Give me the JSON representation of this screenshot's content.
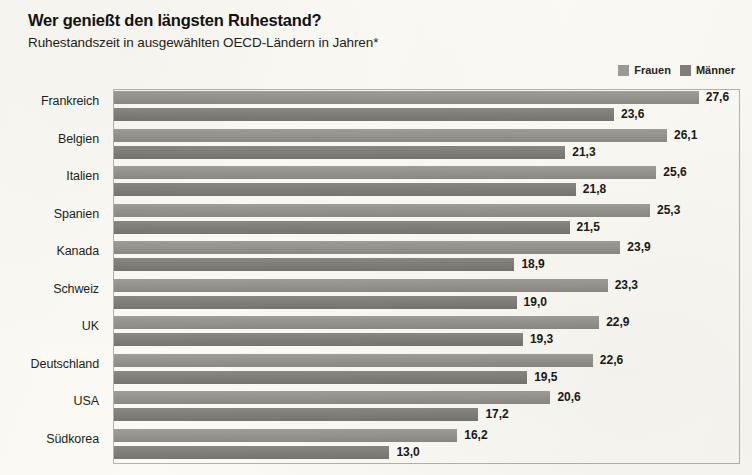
{
  "header": {
    "title": "Wer genießt den längsten Ruhestand?",
    "subtitle": "Ruhestandszeit in ausgewählten OECD-Ländern in Jahren*"
  },
  "legend": {
    "items": [
      {
        "label": "Frauen",
        "color": "#9b9a93",
        "swatch_name": "legend-swatch-frauen"
      },
      {
        "label": "Männer",
        "color": "#807f78",
        "swatch_name": "legend-swatch-maenner"
      }
    ]
  },
  "chart_data": {
    "type": "bar",
    "orientation": "horizontal",
    "title": "Wer genießt den längsten Ruhestand?",
    "subtitle": "Ruhestandszeit in ausgewählten OECD-Ländern in Jahren*",
    "xlabel": "",
    "ylabel": "",
    "xlim": [
      0,
      29.5
    ],
    "grid": false,
    "legend_position": "top-right",
    "categories": [
      "Frankreich",
      "Belgien",
      "Italien",
      "Spanien",
      "Kanada",
      "Schweiz",
      "UK",
      "Deutschland",
      "USA",
      "Südkorea"
    ],
    "series": [
      {
        "name": "Frauen",
        "color": "#9b9a93",
        "values": [
          27.6,
          26.1,
          25.6,
          25.3,
          23.9,
          23.3,
          22.9,
          22.6,
          20.6,
          16.2
        ],
        "labels": [
          "27,6",
          "26,1",
          "25,6",
          "25,3",
          "23,9",
          "23,3",
          "22,9",
          "22,6",
          "20,6",
          "16,2"
        ]
      },
      {
        "name": "Männer",
        "color": "#807f78",
        "values": [
          23.6,
          21.3,
          21.8,
          21.5,
          18.9,
          19.0,
          19.3,
          19.5,
          17.2,
          13.0
        ],
        "labels": [
          "23,6",
          "21,3",
          "21,8",
          "21,5",
          "18,9",
          "19,0",
          "19,3",
          "19,5",
          "17,2",
          "13,0"
        ]
      }
    ]
  }
}
